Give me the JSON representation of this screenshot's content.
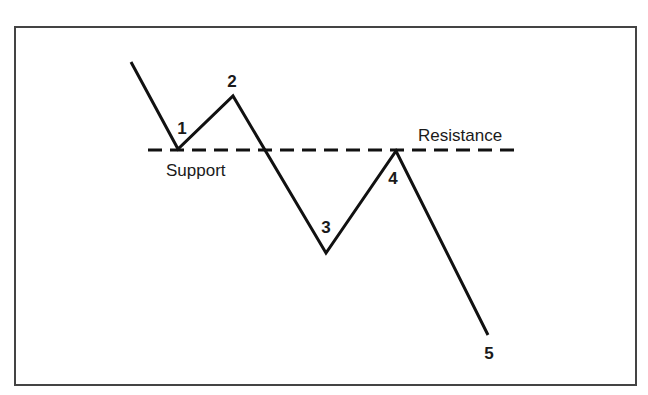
{
  "diagram": {
    "type": "support-resistance-trend-diagram",
    "frame": {
      "x": 15,
      "y": 27,
      "width": 621,
      "height": 358,
      "stroke": "#444444"
    },
    "line_color": "#111111",
    "level": {
      "y": 150,
      "x1": 148,
      "x2": 520,
      "style": "dashed",
      "labels": {
        "support": {
          "text": "Support",
          "x": 166,
          "y": 176
        },
        "resistance": {
          "text": "Resistance",
          "x": 418,
          "y": 141
        }
      }
    },
    "path": [
      {
        "x": 131,
        "y": 62
      },
      {
        "x": 178,
        "y": 149
      },
      {
        "x": 233,
        "y": 96
      },
      {
        "x": 326,
        "y": 253
      },
      {
        "x": 396,
        "y": 151
      },
      {
        "x": 488,
        "y": 335
      }
    ],
    "points": [
      {
        "label": "1",
        "x": 182,
        "y": 134
      },
      {
        "label": "2",
        "x": 232,
        "y": 87
      },
      {
        "label": "3",
        "x": 326,
        "y": 233
      },
      {
        "label": "4",
        "x": 393,
        "y": 184
      },
      {
        "label": "5",
        "x": 489,
        "y": 359
      }
    ]
  }
}
